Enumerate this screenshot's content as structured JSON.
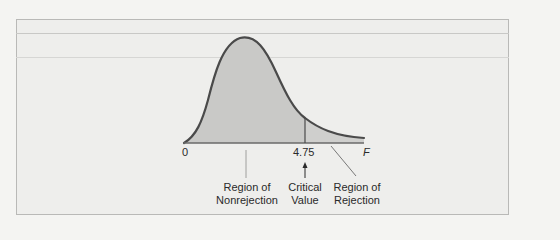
{
  "figure": {
    "type": "F-distribution rejection region diagram",
    "axis": {
      "origin_label": "0",
      "variable_label": "F",
      "critical_value_label": "4.75"
    },
    "annotations": {
      "nonrejection": {
        "line1": "Region of",
        "line2": "Nonrejection"
      },
      "critical": {
        "line1": "Critical",
        "line2": "Value"
      },
      "rejection": {
        "line1": "Region of",
        "line2": "Rejection"
      }
    },
    "colors": {
      "curve": "#4a4a4a",
      "fill": "#c9c9c7",
      "background": "#eeeeec",
      "text": "#2a2a2a"
    }
  }
}
